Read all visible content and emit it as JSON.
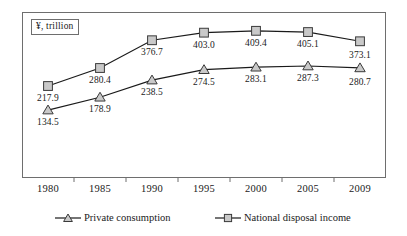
{
  "chart_data": {
    "type": "line",
    "title": "",
    "xlabel": "",
    "ylabel": "",
    "unit_note": "¥, trillion",
    "grid": false,
    "legend_position": "bottom",
    "categories": [
      "1980",
      "1985",
      "1990",
      "1995",
      "2000",
      "2005",
      "2009"
    ],
    "ylim": [
      100,
      440
    ],
    "series": [
      {
        "name": "Private consumption",
        "marker": "triangle",
        "values": [
          134.5,
          178.9,
          238.5,
          274.5,
          283.1,
          287.3,
          280.7
        ],
        "labels": [
          "134.5",
          "178.9",
          "238.5",
          "274.5",
          "283.1",
          "287.3",
          "280.7"
        ]
      },
      {
        "name": "National disposal income",
        "marker": "square",
        "values": [
          217.9,
          280.4,
          376.7,
          403.0,
          409.4,
          405.1,
          373.1
        ],
        "labels": [
          "217.9",
          "280.4",
          "376.7",
          "403.0",
          "409.4",
          "405.1",
          "373.1"
        ]
      }
    ]
  },
  "axis": {
    "unit_box_label": "¥, trillion",
    "tick_labels": [
      "1980",
      "1985",
      "1990",
      "1995",
      "2000",
      "2005",
      "2009"
    ]
  },
  "legend": {
    "entries": [
      {
        "label": "Private consumption",
        "marker": "triangle-marker-icon"
      },
      {
        "label": "National disposal income",
        "marker": "square-marker-icon"
      }
    ]
  },
  "colors": {
    "line": "#1a1a1a",
    "marker_fill": "#c9c9c9",
    "marker_stroke": "#3a3a3a",
    "frame": "#6e6e6e",
    "text": "#1a1a1a"
  }
}
